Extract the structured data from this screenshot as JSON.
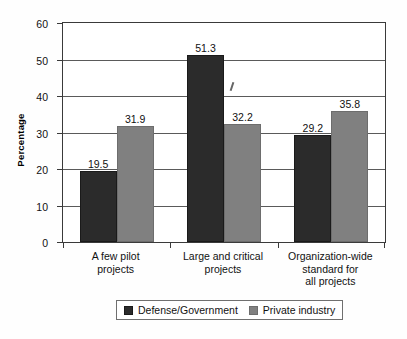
{
  "chart_data": {
    "type": "bar",
    "title": "",
    "xlabel": "",
    "ylabel": "Percentage",
    "ylim": [
      0,
      60
    ],
    "yticks": [
      0,
      10,
      20,
      30,
      40,
      50,
      60
    ],
    "ytick_labels": [
      "0",
      "10",
      "20",
      "30",
      "40",
      "50",
      "60"
    ],
    "grid": true,
    "legend_position": "bottom",
    "categories": [
      "A few pilot projects",
      "Large and critical projects",
      "Organization-wide standard for all projects"
    ],
    "category_lines": [
      [
        "A few pilot",
        "projects"
      ],
      [
        "Large and critical",
        "projects"
      ],
      [
        "Organization-wide",
        "standard for",
        "all projects"
      ]
    ],
    "series": [
      {
        "name": "Defense/Government",
        "color": "#2b2b2b",
        "values": [
          19.5,
          51.3,
          29.2
        ],
        "labels": [
          "19.5",
          "51.3",
          "29.2"
        ]
      },
      {
        "name": "Private industry",
        "color": "#808080",
        "values": [
          31.9,
          32.2,
          35.8
        ],
        "labels": [
          "31.9",
          "32.2",
          "35.8"
        ]
      }
    ]
  },
  "legend": {
    "entries": [
      {
        "label": "Defense/Government",
        "color": "#2b2b2b"
      },
      {
        "label": "Private industry",
        "color": "#808080"
      }
    ]
  },
  "axes": {
    "y_title": "Percentage"
  },
  "colors": {
    "series_dark": "#2b2b2b",
    "series_gray": "#808080",
    "axis": "#3a3a3a",
    "grid": "#5a5a5a",
    "background": "#ffffff"
  }
}
